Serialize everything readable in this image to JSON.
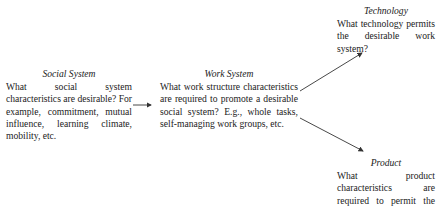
{
  "diagram": {
    "nodes": [
      {
        "id": "social",
        "title": "Social System",
        "text": "What social system characteristics are desirable? For example, commitment, mutual influence, learning climate, mobility, etc."
      },
      {
        "id": "work",
        "title": "Work System",
        "text": "What work structure characteristics are required to promote a desirable social system? E.g., whole tasks, self-managing work groups, etc."
      },
      {
        "id": "technology",
        "title": "Technology",
        "text": "What technology permits the desirable work system?"
      },
      {
        "id": "product",
        "title": "Product",
        "text": "What product characteristics are required to permit the desirable work system?"
      }
    ],
    "edges": [
      {
        "from": "social",
        "to": "work"
      },
      {
        "from": "work",
        "to": "technology"
      },
      {
        "from": "work",
        "to": "product"
      }
    ],
    "line_color": "#333333"
  }
}
